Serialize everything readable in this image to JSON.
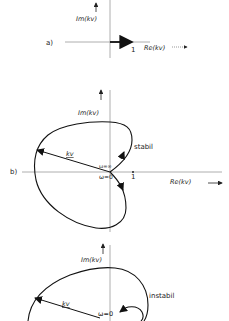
{
  "figure": {
    "panels": [
      {
        "id": "a",
        "label": "a)",
        "im_axis_label": "Im(kv)",
        "re_axis_label": "Re(kv)",
        "unit_point_label": "1",
        "description": "Vector kv on positive real axis up to 1"
      },
      {
        "id": "b",
        "label": "b)",
        "im_axis_label": "Im(kv)",
        "re_axis_label": "Re(kv)",
        "unit_point_label": "1",
        "vector_label": "kv",
        "omega_inf_label": "ω=∞",
        "omega_zero_label": "ω=0",
        "stability_label": "stabil"
      },
      {
        "id": "c",
        "label": "c)",
        "im_axis_label": "Im(kv)",
        "vector_label": "kv",
        "omega_zero_label": "ω=0",
        "stability_label": "instabil"
      }
    ]
  }
}
